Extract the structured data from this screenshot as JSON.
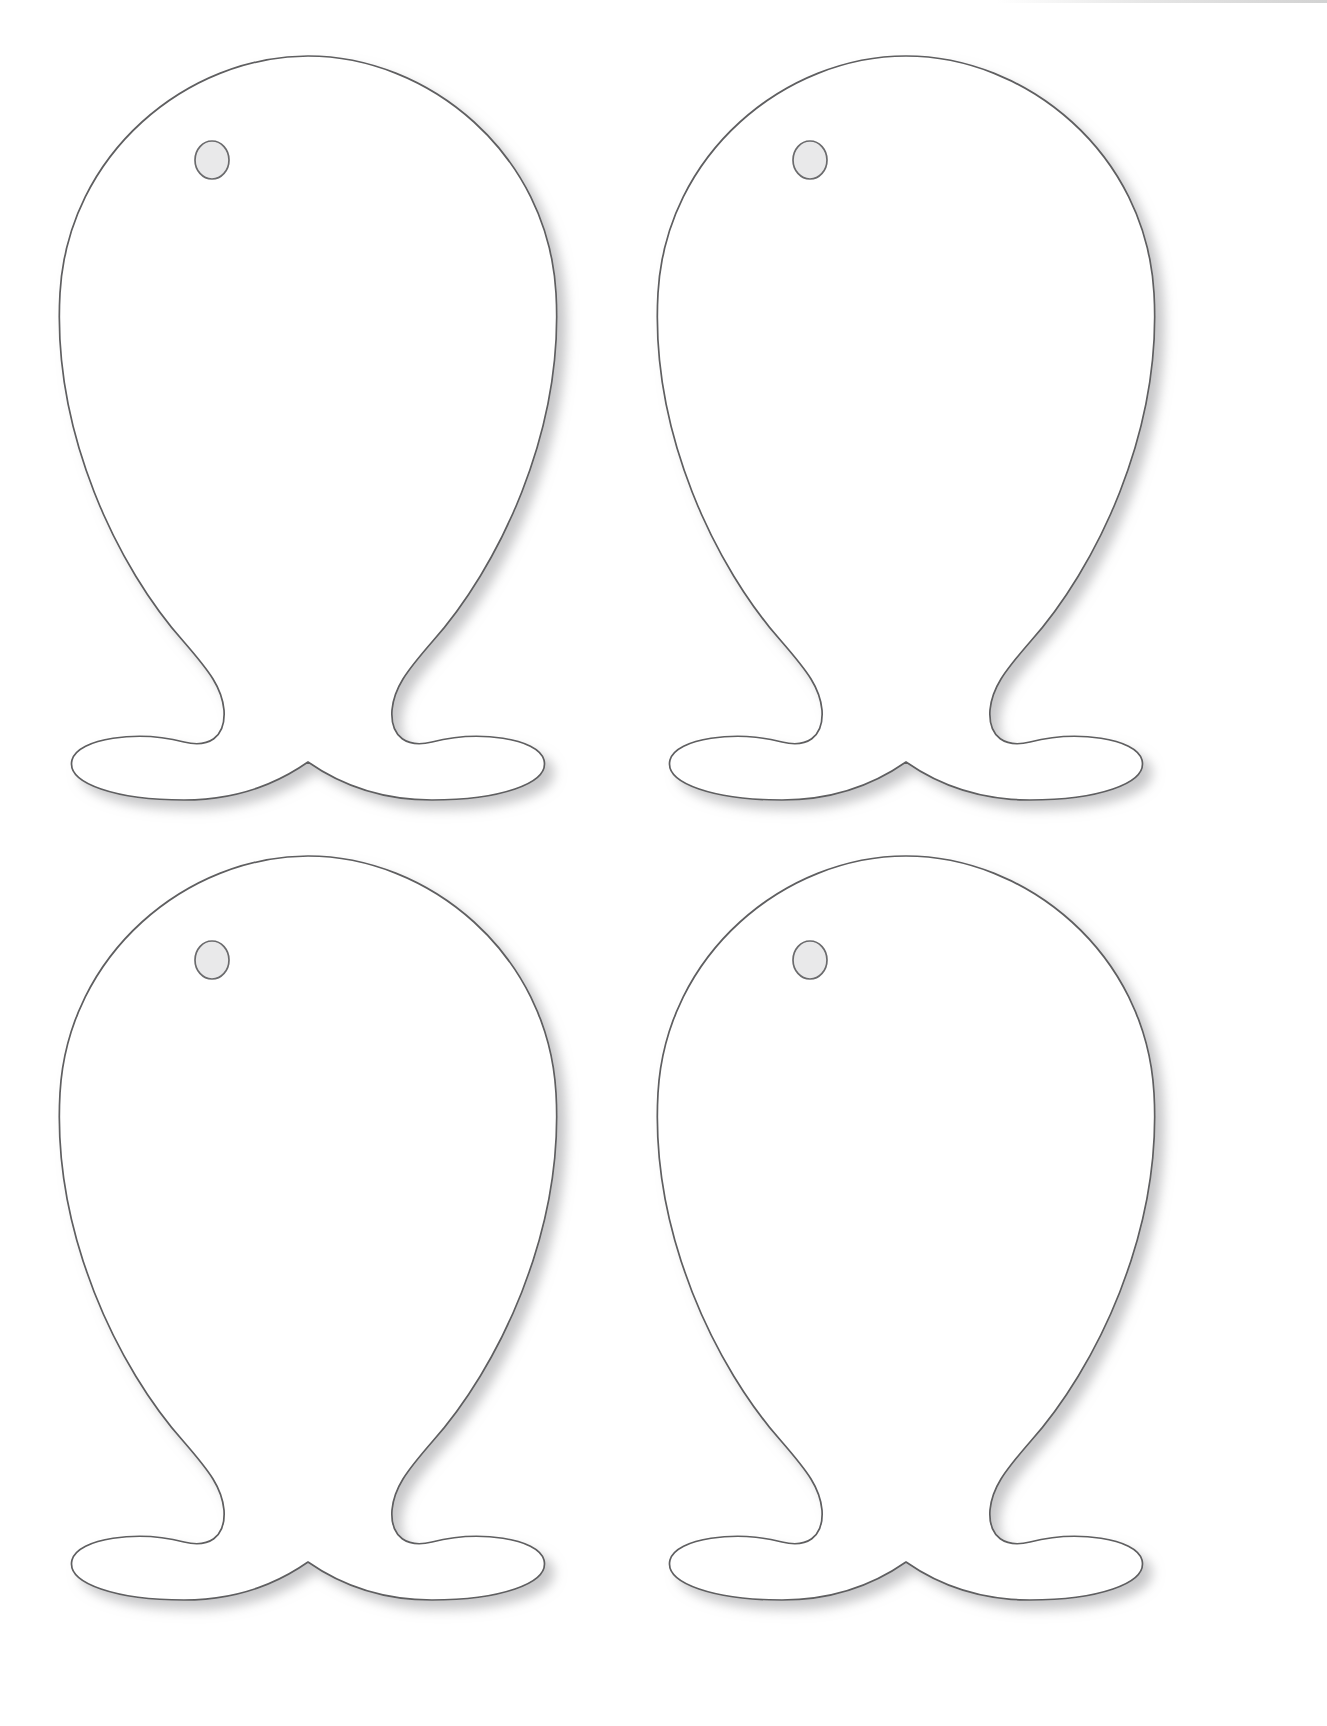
{
  "page": {
    "background_color": "#ffffff",
    "width": 1327,
    "height": 1726,
    "paper_edge_shadow": true
  },
  "artwork": {
    "subject": "fish-outline-template",
    "description": "Four identical blank fish cut-out outlines arranged in a 2 by 2 grid on a white page",
    "count": 4,
    "rows": 2,
    "columns": 2,
    "line_color": "#5e5e60",
    "fill_color": "#ffffff",
    "eye_fill_color": "#e9e9ea",
    "eye_stroke_color": "#6b6b6d",
    "shadow_color": "#b9b9bb",
    "stroke_width": 1.7
  },
  "shapes": [
    {
      "id": "fish-1",
      "label": "Fish outline top left",
      "row": 1,
      "column": 1,
      "left": 28,
      "top": 48,
      "width": 560,
      "height": 760,
      "eye": {
        "cx": 184,
        "cy": 112,
        "rx": 17,
        "ry": 19
      }
    },
    {
      "id": "fish-2",
      "label": "Fish outline top right",
      "row": 1,
      "column": 2,
      "left": 626,
      "top": 48,
      "width": 560,
      "height": 760,
      "eye": {
        "cx": 184,
        "cy": 112,
        "rx": 17,
        "ry": 19
      }
    },
    {
      "id": "fish-3",
      "label": "Fish outline bottom left",
      "row": 2,
      "column": 1,
      "left": 28,
      "top": 848,
      "width": 560,
      "height": 760,
      "eye": {
        "cx": 184,
        "cy": 112,
        "rx": 17,
        "ry": 19
      }
    },
    {
      "id": "fish-4",
      "label": "Fish outline bottom right",
      "row": 2,
      "column": 2,
      "left": 626,
      "top": 848,
      "width": 560,
      "height": 760,
      "eye": {
        "cx": 184,
        "cy": 112,
        "rx": 17,
        "ry": 19
      }
    }
  ],
  "geometry": {
    "body_path": "M 280 8 C 400 8 520 105 528 245 C 536 385 470 520 404 594 C 378 624 366 640 364 662 C 362 690 380 700 404 694 C 450 682 510 690 516 712 C 522 736 470 752 404 752 C 340 752 300 728 280 714 C 260 728 220 752 156 752 C 90 752 38 736 44 712 C 50 690 110 682 156 694 C 180 700 198 690 196 662 C 194 640 182 624 156 594 C 90 520 24 385 32 245 C 40 105 160 8 280 8 Z",
    "viewbox": "0 0 560 760"
  }
}
